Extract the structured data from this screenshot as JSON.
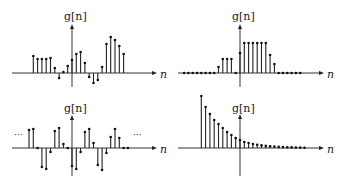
{
  "panels": [
    {
      "id": "aperiodic",
      "ylabel": "g[n]",
      "xlabel": "n"
    },
    {
      "id": "finite-pulse",
      "ylabel": "g[n]",
      "xlabel": "n"
    },
    {
      "id": "periodic",
      "ylabel": "g[n]",
      "xlabel": "n",
      "ellipsis_left": "···",
      "ellipsis_right": "···"
    },
    {
      "id": "decaying",
      "ylabel": "g[n]",
      "xlabel": "n"
    }
  ],
  "chart_data": [
    {
      "type": "stem",
      "title": "",
      "ylabel": "g[n]",
      "xlabel": "n",
      "x": [
        -9,
        -8,
        -7,
        -6,
        -5,
        -4,
        -3,
        -2,
        -1,
        0,
        1,
        2,
        3,
        4,
        5,
        6,
        7,
        8,
        9,
        10,
        11,
        12
      ],
      "values": [
        17,
        14,
        14,
        14,
        15,
        5,
        -5,
        1,
        7,
        13,
        19,
        21,
        10,
        -4,
        -10,
        -7,
        6,
        29,
        36,
        33,
        27,
        19
      ]
    },
    {
      "type": "stem",
      "title": "",
      "ylabel": "g[n]",
      "xlabel": "n",
      "x": [
        -13,
        -12,
        -11,
        -10,
        -9,
        -8,
        -7,
        -6,
        -5,
        -4,
        -3,
        -2,
        -1,
        0,
        1,
        2,
        3,
        4,
        5,
        6,
        7,
        8,
        9,
        10,
        11,
        12,
        13,
        14
      ],
      "values": [
        0,
        0,
        0,
        0,
        0,
        0,
        0,
        0,
        6,
        14,
        14,
        14,
        0,
        20,
        30,
        30,
        30,
        30,
        30,
        30,
        18,
        9,
        0,
        0,
        0,
        0,
        0,
        0
      ]
    },
    {
      "type": "stem",
      "title": "",
      "ylabel": "g[n]",
      "xlabel": "n",
      "periodic": true,
      "period": 6,
      "x": [
        -10,
        -9,
        -8,
        -7,
        -6,
        -5,
        -4,
        -3,
        -2,
        -1,
        0,
        1,
        2,
        3,
        4,
        5,
        6,
        7,
        8,
        9,
        10,
        11,
        12,
        13
      ],
      "values": [
        18,
        19,
        0,
        -19,
        -21,
        -4,
        17,
        20,
        4,
        0,
        -18,
        -21,
        -4,
        16,
        19,
        5,
        -17,
        -22,
        -5,
        11,
        19,
        10,
        0,
        0
      ]
    },
    {
      "type": "stem",
      "title": "",
      "ylabel": "g[n]",
      "xlabel": "n",
      "x": [
        -9,
        -8,
        -7,
        -6,
        -5,
        -4,
        -3,
        -2,
        -1,
        0,
        1,
        2,
        3,
        4,
        5,
        6,
        7,
        8,
        9,
        10,
        11,
        12,
        13,
        14,
        15
      ],
      "values": [
        52,
        41,
        34,
        28,
        24,
        20,
        16,
        13,
        10,
        8,
        6,
        5,
        4,
        3.2,
        2.6,
        2.1,
        1.7,
        1.4,
        1.1,
        0.9,
        0.7,
        0.6,
        0.5,
        0.4,
        0.3
      ]
    }
  ]
}
